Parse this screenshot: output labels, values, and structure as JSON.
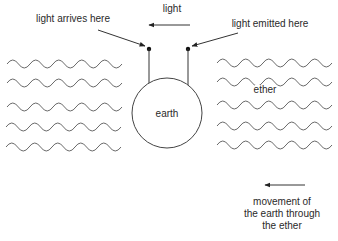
{
  "diagram": {
    "type": "physics-diagram",
    "labels": {
      "light": "light",
      "light_arrives": "light arrives here",
      "light_emitted": "light emitted here",
      "earth": "earth",
      "ether": "ether",
      "movement_line1": "movement of",
      "movement_line2": "the earth through",
      "movement_line3": "the ether"
    },
    "elements": {
      "earth_circle": {
        "cx": 167,
        "cy": 112,
        "r": 35
      },
      "receiver_dot": {
        "x": 149,
        "y": 49
      },
      "emitter_dot": {
        "x": 188,
        "y": 49
      },
      "light_arrow": {
        "from_x": 190,
        "to_x": 148,
        "y": 25,
        "direction": "left"
      },
      "movement_arrow": {
        "from_x": 305,
        "to_x": 265,
        "y": 185,
        "direction": "left"
      },
      "left_ether_waves": {
        "count": 5,
        "rows_y": [
          60,
          79,
          103,
          123,
          143
        ],
        "x_start": 7,
        "x_end": 120
      },
      "right_ether_waves": {
        "count": 5,
        "rows_y": [
          59,
          78,
          101,
          122,
          141
        ],
        "x_start": 217,
        "x_end": 330
      }
    },
    "colors": {
      "lines": "#333333",
      "waves": "#6a6a6a",
      "text": "#2a2a2a"
    }
  }
}
